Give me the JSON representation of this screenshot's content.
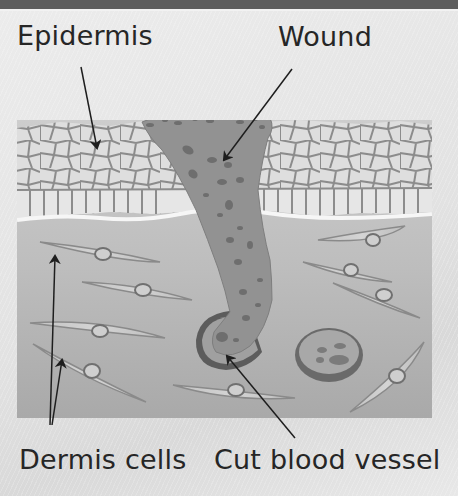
{
  "diagram": {
    "labels": {
      "epidermis": "Epidermis",
      "wound": "Wound",
      "dermis_cells": "Dermis cells",
      "cut_blood_vessel": "Cut blood vessel"
    },
    "colors": {
      "top_band": "#5e5e5e",
      "background": "#e6e6e6",
      "epidermis_fill": "#dcdcdc",
      "epidermis_lines": "#8a8a8a",
      "dermis_fill": "#b9b9b9",
      "wound_fill": "#8f8f8f",
      "vessel_ring": "#5a5a5a",
      "label_text": "#262626",
      "arrow": "#1e1e1e"
    }
  }
}
